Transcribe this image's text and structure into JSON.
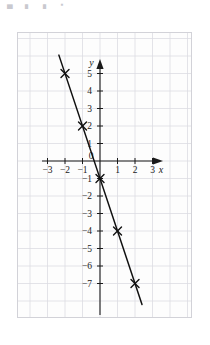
{
  "top_clip": {
    "text": "▄ ▖ ▖ ▪"
  },
  "figure": {
    "caption": "",
    "background_color": "#fdfdfd",
    "grid_color": "#dcdce2",
    "axis_color": "#1a1a1a",
    "line_color": "#111111",
    "marker_color": "#111111",
    "axis_labels": {
      "x": "x",
      "y": "y"
    },
    "origin_label": "0"
  },
  "chart_data": {
    "type": "line",
    "title": "",
    "xlabel": "x",
    "ylabel": "y",
    "xlim": [
      -4,
      4
    ],
    "ylim": [
      -8,
      6
    ],
    "grid": true,
    "legend": "none",
    "x_ticks": [
      -3,
      -2,
      -1,
      1,
      2,
      3
    ],
    "x_tick_labels": [
      "−3",
      "−2",
      "−1",
      "1",
      "2",
      "3"
    ],
    "y_ticks": [
      5,
      4,
      3,
      2,
      1,
      -1,
      -2,
      -3,
      -4,
      -5,
      -6,
      -7
    ],
    "y_tick_labels": [
      "5",
      "4",
      "3",
      "2",
      "1",
      "−1",
      "−2",
      "−3",
      "−4",
      "−5",
      "−6",
      "−7"
    ],
    "origin_label": "0",
    "series": [
      {
        "name": "plotted line",
        "marker": "cross",
        "slope": -3,
        "intercept": -1,
        "line_x_range": [
          -2.35,
          2.4
        ],
        "points": [
          {
            "x": -2,
            "y": 5
          },
          {
            "x": -1,
            "y": 2
          },
          {
            "x": 0,
            "y": -1
          },
          {
            "x": 1,
            "y": -4
          },
          {
            "x": 2,
            "y": -7
          }
        ]
      }
    ]
  }
}
